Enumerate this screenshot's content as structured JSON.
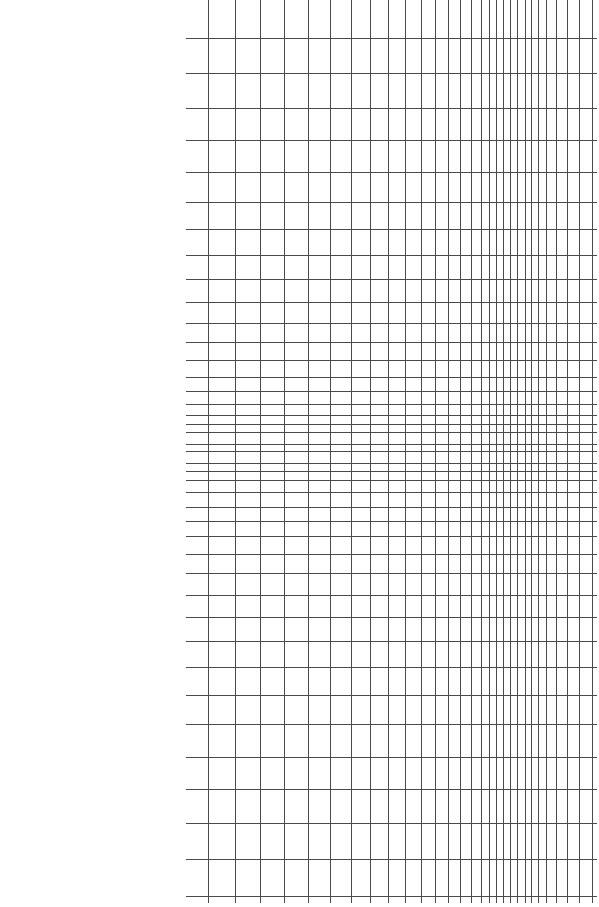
{
  "chart_data": {
    "type": "grid",
    "title": "",
    "xlabel": "",
    "ylabel": "",
    "grid": true,
    "legend": null,
    "line_color": "#4a4a4a",
    "background_color": "#ffffff",
    "plot_area": {
      "left": 186,
      "right": 597,
      "top": 0,
      "bottom": 903
    },
    "vertical_lines_x": [
      208,
      235,
      260,
      284,
      308,
      330,
      351,
      370,
      388,
      405,
      421,
      435,
      448,
      460,
      471,
      481,
      489,
      496,
      503,
      510,
      517,
      525,
      531,
      538,
      546,
      556,
      567,
      579,
      592
    ],
    "horizontal_lines_y": [
      38,
      73,
      108,
      140,
      172,
      202,
      229,
      255,
      279,
      302,
      323,
      342,
      360,
      377,
      391,
      404,
      415,
      424,
      432,
      444,
      451,
      463,
      471,
      480,
      492,
      507,
      521,
      536,
      554,
      573,
      595,
      617,
      641,
      667,
      695,
      724,
      757,
      789,
      823,
      859,
      896
    ]
  }
}
